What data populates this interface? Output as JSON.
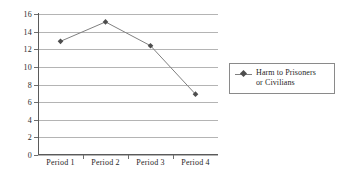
{
  "chart_data": {
    "type": "line",
    "title": "",
    "xlabel": "",
    "ylabel": "",
    "categories": [
      "Period 1",
      "Period 2",
      "Period 3",
      "Period 4"
    ],
    "series": [
      {
        "name": "Harm to Prisoners or Civilians",
        "values": [
          12.9,
          15.1,
          12.4,
          6.9
        ],
        "marker": "diamond",
        "line_color": "#808080",
        "marker_color": "#4d4d4d"
      }
    ],
    "ylim": [
      0,
      16
    ],
    "ytick_step": 2,
    "yticks": [
      0,
      2,
      4,
      6,
      8,
      10,
      12,
      14,
      16
    ],
    "ytick_labels": [
      "0",
      "2",
      "4",
      "6",
      "8",
      "10",
      "12",
      "14",
      "16"
    ],
    "grid": true,
    "grid_color": "#b4b4b4",
    "legend_position": "right",
    "legend_entries": [
      "Harm to Prisoners or Civilians"
    ]
  },
  "legend": {
    "line1": "Harm to Prisoners",
    "line2": "or Civilians"
  }
}
